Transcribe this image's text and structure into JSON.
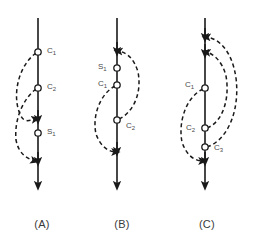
{
  "figure": {
    "background_color": "#ffffff",
    "stroke_color": "#1a1a1a",
    "label_color": "#4a4a4a",
    "node_fill": "#ffffff",
    "panels": [
      {
        "caption": "(A)",
        "axis_x": 38,
        "nodes": [
          {
            "id": "A-n1",
            "label_base": "C",
            "label_sub": "1",
            "cx": 38,
            "cy": 52,
            "label_x": 47,
            "label_y": 47
          },
          {
            "id": "A-n2",
            "label_base": "C",
            "label_sub": "2",
            "cx": 38,
            "cy": 88,
            "label_x": 47,
            "label_y": 83
          },
          {
            "id": "A-n3",
            "label_base": "S",
            "label_sub": "1",
            "cx": 38,
            "cy": 133,
            "label_x": 47,
            "label_y": 128
          }
        ]
      },
      {
        "caption": "(B)",
        "axis_x": 117,
        "nodes": [
          {
            "id": "B-n1",
            "label_base": "S",
            "label_sub": "1",
            "cx": 117,
            "cy": 68,
            "label_x": 98,
            "label_y": 63
          },
          {
            "id": "B-n2",
            "label_base": "C",
            "label_sub": "1",
            "cx": 117,
            "cy": 85,
            "label_x": 98,
            "label_y": 80
          },
          {
            "id": "B-n3",
            "label_base": "C",
            "label_sub": "2",
            "cx": 117,
            "cy": 120,
            "label_x": 126,
            "label_y": 122
          }
        ]
      },
      {
        "caption": "(C)",
        "axis_x": 205,
        "nodes": [
          {
            "id": "C-n1",
            "label_base": "C",
            "label_sub": "1",
            "cx": 205,
            "cy": 88,
            "label_x": 185,
            "label_y": 81
          },
          {
            "id": "C-n2",
            "label_base": "C",
            "label_sub": "2",
            "cx": 205,
            "cy": 128,
            "label_x": 186,
            "label_y": 124
          },
          {
            "id": "C-n3",
            "label_base": "C",
            "label_sub": "3",
            "cx": 205,
            "cy": 147,
            "label_x": 214,
            "label_y": 144
          }
        ]
      }
    ]
  },
  "chart_data": {
    "type": "diagram",
    "title": "",
    "panels": [
      {
        "name": "(A)",
        "axis": {
          "x": 38,
          "y_top": 18,
          "y_bottom": 190,
          "direction": "down"
        },
        "nodes": [
          {
            "label": "C1",
            "y": 52
          },
          {
            "label": "C2",
            "y": 88
          },
          {
            "label": "S1",
            "y": 133
          }
        ],
        "axis_arrowheads_y": [
          120,
          160,
          188
        ],
        "dashed_arcs": [
          {
            "from": "C1",
            "to": "axis-120",
            "bulge": "left"
          },
          {
            "from": "C2",
            "to": "axis-160",
            "bulge": "left"
          }
        ]
      },
      {
        "name": "(B)",
        "axis": {
          "x": 117,
          "y_top": 18,
          "y_bottom": 190,
          "direction": "down"
        },
        "nodes": [
          {
            "label": "S1",
            "y": 68
          },
          {
            "label": "C1",
            "y": 85
          },
          {
            "label": "C2",
            "y": 120
          }
        ],
        "axis_arrowheads_y": [
          52,
          152,
          188
        ],
        "dashed_arcs": [
          {
            "from": "C2",
            "to": "axis-52",
            "bulge": "right"
          },
          {
            "from": "C1",
            "to": "axis-152",
            "bulge": "left"
          }
        ]
      },
      {
        "name": "(C)",
        "axis": {
          "x": 205,
          "y_top": 18,
          "y_bottom": 190,
          "direction": "down"
        },
        "nodes": [
          {
            "label": "C1",
            "y": 88
          },
          {
            "label": "C2",
            "y": 128
          },
          {
            "label": "C3",
            "y": 147
          }
        ],
        "axis_arrowheads_y": [
          38,
          52,
          162,
          188
        ],
        "dashed_arcs": [
          {
            "from": "C3",
            "to": "axis-38",
            "bulge": "right"
          },
          {
            "from": "C2",
            "to": "axis-52",
            "bulge": "right"
          },
          {
            "from": "C1",
            "to": "axis-162",
            "bulge": "left"
          }
        ]
      }
    ]
  }
}
